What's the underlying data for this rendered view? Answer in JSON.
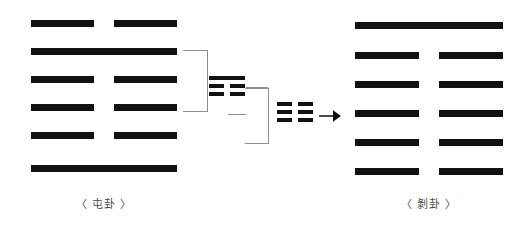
{
  "diagram": {
    "type": "iching-hexagram-transformation",
    "background_color": "#ffffff",
    "line_color": "#111111",
    "bracket_color": "#8d8d8d",
    "caption_color": "#4a4a4a",
    "arrow": {
      "glyph": "arrow-right",
      "label": "→"
    },
    "source": {
      "name": "tun-hexagram",
      "caption": "〈 屯卦 〉",
      "lines_top_to_bottom": [
        "yin",
        "yang",
        "yin",
        "yin",
        "yin",
        "yang"
      ],
      "rows": [
        {
          "index": 0,
          "type": "yin",
          "left": "",
          "right": ""
        },
        {
          "index": 1,
          "type": "yang",
          "left": "",
          "right": ""
        },
        {
          "index": 2,
          "type": "yin",
          "left": "",
          "right": ""
        },
        {
          "index": 3,
          "type": "yin",
          "left": "",
          "right": ""
        },
        {
          "index": 4,
          "type": "yin",
          "left": "",
          "right": ""
        },
        {
          "index": 5,
          "type": "yang",
          "left": "",
          "right": ""
        }
      ]
    },
    "result": {
      "name": "bo-hexagram",
      "caption": "〈 剝卦 〉",
      "lines_top_to_bottom": [
        "yang",
        "yin",
        "yin",
        "yin",
        "yin",
        "yin"
      ],
      "rows": [
        {
          "index": 0,
          "type": "yang",
          "left": "",
          "right": ""
        },
        {
          "index": 1,
          "type": "yin",
          "left": "",
          "right": ""
        },
        {
          "index": 2,
          "type": "yin",
          "left": "",
          "right": ""
        },
        {
          "index": 3,
          "type": "yin",
          "left": "",
          "right": ""
        },
        {
          "index": 4,
          "type": "yin",
          "left": "",
          "right": ""
        },
        {
          "index": 5,
          "type": "yin",
          "left": "",
          "right": ""
        }
      ]
    },
    "trigrams": [
      {
        "name": "gen-trigram",
        "glyph": "☶",
        "lines_top_to_bottom": [
          "yang",
          "yin",
          "yin"
        ]
      },
      {
        "name": "kun-trigram",
        "glyph": "☷",
        "lines_top_to_bottom": [
          "yin",
          "yin",
          "yin"
        ]
      }
    ]
  }
}
